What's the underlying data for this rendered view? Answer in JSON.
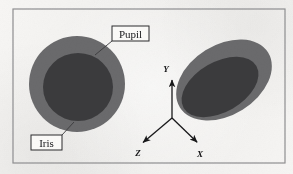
{
  "figure": {
    "background_color": "#f4f3f1",
    "frame": {
      "name": "figure-border",
      "x": 13,
      "y": 9,
      "width": 272,
      "height": 154,
      "stroke_color": "#8e8e90",
      "stroke_width": 1.2
    },
    "callouts": [
      {
        "id": "pupil",
        "label": "Pupil",
        "box": {
          "x": 112,
          "y": 26,
          "width": 37,
          "height": 15
        },
        "box_stroke": "#2a2a2c",
        "text_color": "#17171a",
        "leader": {
          "x1": 112,
          "y1": 41,
          "x2": 95,
          "y2": 55
        }
      },
      {
        "id": "iris",
        "label": "Iris",
        "box": {
          "x": 31,
          "y": 135,
          "width": 31,
          "height": 15
        },
        "box_stroke": "#2a2a2c",
        "text_color": "#17171a",
        "leader": {
          "x1": 62,
          "y1": 135,
          "x2": 74,
          "y2": 122
        }
      }
    ],
    "eyes": [
      {
        "id": "left-eye-frontal",
        "iris": {
          "cx": 77,
          "cy": 84,
          "rx": 48,
          "ry": 48,
          "rotation": 0,
          "color": "#6a6a6c"
        },
        "pupil": {
          "cx": 78,
          "cy": 87,
          "rx": 35,
          "ry": 34,
          "rotation": 0,
          "color": "#3b3b3d"
        }
      },
      {
        "id": "right-eye-rotated",
        "iris": {
          "cx": 224,
          "cy": 80,
          "rx": 52,
          "ry": 35,
          "rotation": -32,
          "color": "#6a6a6c"
        },
        "pupil": {
          "cx": 220,
          "cy": 87,
          "rx": 42,
          "ry": 25,
          "rotation": -30,
          "color": "#3b3b3d"
        }
      }
    ],
    "axes": {
      "name": "coordinate-axes",
      "origin": {
        "x": 172,
        "y": 118
      },
      "stroke_color": "#18181a",
      "stroke_width": 1.3,
      "arrows": [
        {
          "id": "y-axis",
          "label": "Y",
          "tip_x": 172,
          "tip_y": 76,
          "label_x": 166,
          "label_y": 72
        },
        {
          "id": "z-axis",
          "label": "Z",
          "tip_x": 140,
          "tip_y": 145,
          "label_x": 138,
          "label_y": 156
        },
        {
          "id": "x-axis",
          "label": "X",
          "tip_x": 200,
          "tip_y": 145,
          "label_x": 200,
          "label_y": 157
        }
      ]
    }
  }
}
